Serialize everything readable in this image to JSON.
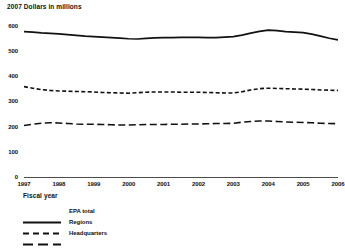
{
  "chart_data": {
    "type": "line",
    "title": "2007 Dollars in millions",
    "xlabel": "Fiscal year",
    "ylabel": "",
    "grid": false,
    "legend_position": "bottom-left",
    "ylim": [
      0,
      650
    ],
    "yticks": [
      0,
      100,
      200,
      300,
      400,
      500,
      600
    ],
    "ytick_labels": [
      "0",
      "100",
      "200",
      "300",
      "400",
      "500",
      "600"
    ],
    "categories": [
      "1997",
      "1998",
      "1999",
      "2000",
      "2001",
      "2002",
      "2003",
      "2004",
      "2005",
      "2006"
    ],
    "x": [
      1997,
      1998,
      1999,
      2000,
      2001,
      2002,
      2003,
      2004,
      2005,
      2006
    ],
    "xlim": [
      1997,
      2006
    ],
    "series": [
      {
        "name": "EPA total",
        "style": "solid",
        "color": "#111111",
        "values": [
          580,
          571,
          560,
          552,
          556,
          557,
          560,
          586,
          576,
          547
        ],
        "detail_x": [
          1997.0,
          1997.25,
          1997.5,
          1997.75,
          1998.0,
          1998.25,
          1998.5,
          1998.75,
          1999.0,
          1999.25,
          1999.5,
          1999.75,
          2000.0,
          2000.25,
          2000.5,
          2000.75,
          2001.0,
          2001.25,
          2001.5,
          2001.75,
          2002.0,
          2002.25,
          2002.5,
          2002.75,
          2003.0,
          2003.25,
          2003.5,
          2003.75,
          2004.0,
          2004.25,
          2004.5,
          2004.75,
          2005.0,
          2005.25,
          2005.5,
          2005.75,
          2006.0
        ],
        "detail_y": [
          580,
          578,
          575,
          573,
          571,
          568,
          565,
          562,
          560,
          558,
          556,
          554,
          552,
          551,
          553,
          555,
          556,
          556,
          557,
          557,
          557,
          556,
          556,
          558,
          560,
          566,
          574,
          581,
          586,
          584,
          580,
          578,
          576,
          570,
          562,
          554,
          547
        ]
      },
      {
        "name": "Regions",
        "style": "dashed",
        "color": "#111111",
        "values": [
          362,
          345,
          341,
          336,
          341,
          340,
          337,
          356,
          352,
          347
        ],
        "detail_x": [
          1997.0,
          1997.25,
          1997.5,
          1997.75,
          1998.0,
          1998.25,
          1998.5,
          1998.75,
          1999.0,
          1999.25,
          1999.5,
          1999.75,
          2000.0,
          2000.25,
          2000.5,
          2000.75,
          2001.0,
          2001.25,
          2001.5,
          2001.75,
          2002.0,
          2002.25,
          2002.5,
          2002.75,
          2003.0,
          2003.25,
          2003.5,
          2003.75,
          2004.0,
          2004.25,
          2004.5,
          2004.75,
          2005.0,
          2005.25,
          2005.5,
          2005.75,
          2006.0
        ],
        "detail_y": [
          362,
          356,
          350,
          347,
          345,
          344,
          343,
          342,
          341,
          339,
          338,
          337,
          336,
          338,
          340,
          341,
          341,
          341,
          340,
          340,
          340,
          339,
          338,
          337,
          337,
          342,
          349,
          354,
          356,
          355,
          354,
          353,
          352,
          351,
          349,
          348,
          347
        ]
      },
      {
        "name": "Headquarters",
        "style": "longdash",
        "color": "#111111",
        "values": [
          208,
          218,
          213,
          210,
          212,
          214,
          217,
          226,
          220,
          215
        ],
        "detail_x": [
          1997.0,
          1997.25,
          1997.5,
          1997.75,
          1998.0,
          1998.25,
          1998.5,
          1998.75,
          1999.0,
          1999.25,
          1999.5,
          1999.75,
          2000.0,
          2000.25,
          2000.5,
          2000.75,
          2001.0,
          2001.25,
          2001.5,
          2001.75,
          2002.0,
          2002.25,
          2002.5,
          2002.75,
          2003.0,
          2003.25,
          2003.5,
          2003.75,
          2004.0,
          2004.25,
          2004.5,
          2004.75,
          2005.0,
          2005.25,
          2005.5,
          2005.75,
          2006.0
        ],
        "detail_y": [
          208,
          213,
          217,
          219,
          218,
          216,
          214,
          213,
          213,
          212,
          211,
          210,
          210,
          211,
          212,
          212,
          212,
          213,
          213,
          214,
          214,
          215,
          216,
          216,
          217,
          221,
          224,
          226,
          226,
          224,
          222,
          221,
          220,
          219,
          217,
          216,
          215
        ]
      }
    ]
  },
  "legend": {
    "items": [
      {
        "label": "EPA total",
        "style": "solid"
      },
      {
        "label": "Regions",
        "style": "dashed"
      },
      {
        "label": "Headquarters",
        "style": "longdash"
      }
    ]
  }
}
